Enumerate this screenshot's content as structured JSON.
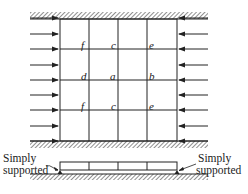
{
  "figure": {
    "grid_nodes": [
      {
        "id": "f",
        "row": 1,
        "col": 1
      },
      {
        "id": "c",
        "row": 1,
        "col": 2
      },
      {
        "id": "e",
        "row": 1,
        "col": 3
      },
      {
        "id": "d",
        "row": 2,
        "col": 1
      },
      {
        "id": "a",
        "row": 2,
        "col": 2
      },
      {
        "id": "b",
        "row": 2,
        "col": 3
      },
      {
        "id": "f",
        "row": 3,
        "col": 1
      },
      {
        "id": "c",
        "row": 3,
        "col": 2
      },
      {
        "id": "e",
        "row": 3,
        "col": 3
      }
    ],
    "labels": {
      "n_f1": "f",
      "n_c1": "c",
      "n_e1": "e",
      "n_d": "d",
      "n_a": "a",
      "n_b": "b",
      "n_f2": "f",
      "n_c2": "c",
      "n_e2": "e"
    },
    "support_left": {
      "line1": "Simply",
      "line2": "supported"
    },
    "support_right": {
      "line1": "Simply",
      "line2": "supported"
    },
    "arrows_per_side": 9,
    "grid": {
      "columns": 4,
      "rows": 4
    },
    "colors": {
      "line": "#222222",
      "hatch": "#555555",
      "background": "#ffffff"
    }
  }
}
